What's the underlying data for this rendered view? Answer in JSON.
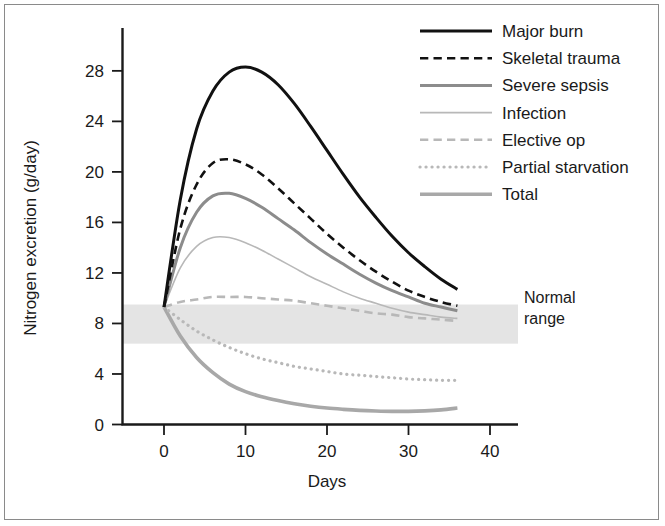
{
  "chart_data": {
    "type": "line",
    "title": "",
    "xlabel": "Days",
    "ylabel": "Nitrogen excretion (g/day)",
    "xlim": [
      -2,
      45
    ],
    "ylim": [
      -1.2,
      30.5
    ],
    "xticks": [
      "0",
      "10",
      "20",
      "30",
      "40"
    ],
    "xtick_values": [
      0,
      10,
      20,
      30,
      40
    ],
    "yticks": [
      "0",
      "4",
      "8",
      "12",
      "16",
      "20",
      "24",
      "28"
    ],
    "ytick_values": [
      0,
      4,
      8,
      12,
      16,
      20,
      24,
      28
    ],
    "grid": false,
    "legend_position": "top-right",
    "annotations": [
      {
        "name": "normal-range-band",
        "label_line1": "Normal",
        "label_line2": "range",
        "y_low": 6.4,
        "y_high": 9.5,
        "color": "#e4e4e4"
      }
    ],
    "x": [
      0,
      2,
      4,
      6,
      8,
      10,
      12,
      14,
      16,
      18,
      20,
      22,
      24,
      26,
      28,
      30,
      32,
      34,
      36
    ],
    "series": [
      {
        "name": "Major burn",
        "color": "#111111",
        "width": 3.0,
        "dash": "solid",
        "values": [
          9.3,
          17.8,
          23.4,
          26.4,
          27.9,
          28.3,
          27.9,
          26.9,
          25.4,
          23.6,
          21.7,
          19.8,
          18.0,
          16.4,
          14.9,
          13.6,
          12.5,
          11.5,
          10.7
        ]
      },
      {
        "name": "Skeletal trauma",
        "color": "#111111",
        "width": 2.6,
        "dash": "dashed",
        "values": [
          9.3,
          15.5,
          19.0,
          20.7,
          21.0,
          20.6,
          19.8,
          18.7,
          17.5,
          16.3,
          15.1,
          14.0,
          13.0,
          12.1,
          11.3,
          10.6,
          10.1,
          9.7,
          9.4
        ]
      },
      {
        "name": "Severe sepsis",
        "color": "#8c8c8c",
        "width": 3.0,
        "dash": "solid",
        "values": [
          9.3,
          14.0,
          16.8,
          18.1,
          18.3,
          17.9,
          17.2,
          16.3,
          15.4,
          14.4,
          13.5,
          12.7,
          11.9,
          11.2,
          10.6,
          10.1,
          9.6,
          9.3,
          9.0
        ]
      },
      {
        "name": "Infection",
        "color": "#b8b8b8",
        "width": 1.6,
        "dash": "solid",
        "values": [
          9.3,
          12.4,
          14.1,
          14.8,
          14.8,
          14.4,
          13.8,
          13.1,
          12.4,
          11.7,
          11.1,
          10.5,
          10.0,
          9.6,
          9.2,
          8.9,
          8.7,
          8.5,
          8.4
        ]
      },
      {
        "name": "Elective op",
        "color": "#b8b8b8",
        "width": 2.6,
        "dash": "dashed",
        "values": [
          9.3,
          9.7,
          9.9,
          10.1,
          10.1,
          10.1,
          10.0,
          9.9,
          9.8,
          9.6,
          9.4,
          9.2,
          9.0,
          8.8,
          8.7,
          8.5,
          8.4,
          8.3,
          8.2
        ]
      },
      {
        "name": "Partial starvation",
        "color": "#b8b8b8",
        "width": 3.2,
        "dash": "dotted",
        "values": [
          9.3,
          8.3,
          7.4,
          6.7,
          6.1,
          5.6,
          5.2,
          4.9,
          4.6,
          4.4,
          4.2,
          4.0,
          3.9,
          3.8,
          3.7,
          3.6,
          3.55,
          3.5,
          3.5
        ]
      },
      {
        "name": "Total",
        "color": "#a8a8a8",
        "width": 3.6,
        "dash": "solid",
        "values": [
          9.3,
          7.0,
          5.3,
          4.1,
          3.2,
          2.6,
          2.2,
          1.9,
          1.65,
          1.45,
          1.3,
          1.2,
          1.12,
          1.07,
          1.04,
          1.04,
          1.08,
          1.16,
          1.3
        ]
      }
    ]
  },
  "legend": {
    "items": [
      {
        "label": "Major burn",
        "sample": "solid-black-thick"
      },
      {
        "label": "Skeletal trauma",
        "sample": "dashed-black"
      },
      {
        "label": "Severe sepsis",
        "sample": "solid-gray-thick"
      },
      {
        "label": "Infection",
        "sample": "solid-lightgray-thin"
      },
      {
        "label": "Elective op",
        "sample": "dashed-lightgray"
      },
      {
        "label": "Partial starvation",
        "sample": "dotted-lightgray"
      },
      {
        "label": "Total",
        "sample": "solid-gray-thickest"
      }
    ]
  }
}
